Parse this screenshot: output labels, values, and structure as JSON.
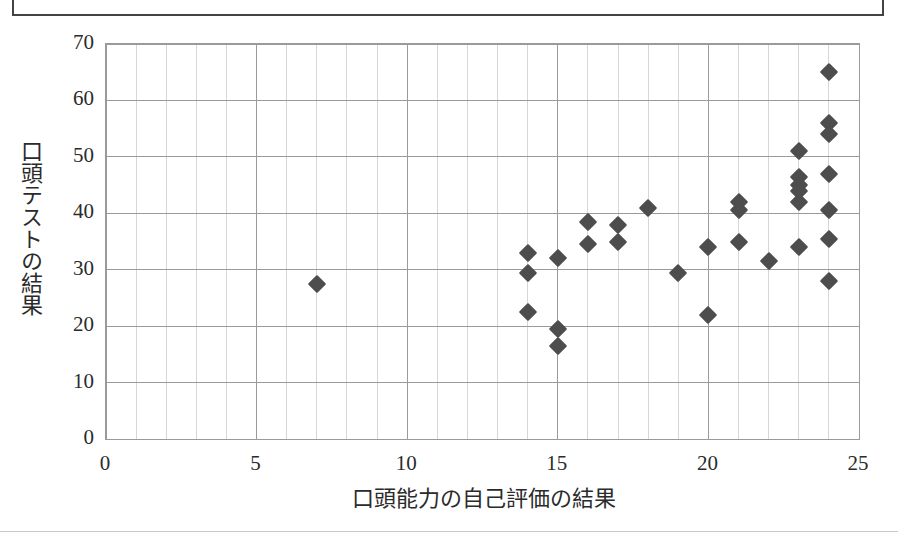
{
  "figure": {
    "y_axis_title": "口頭テストの結果",
    "x_axis_title": "口頭能力の自己評価の結果"
  },
  "chart_data": {
    "type": "scatter",
    "title": "",
    "xlabel": "口頭能力の自己評価の結果",
    "ylabel": "口頭テストの結果",
    "xlim": [
      0,
      25
    ],
    "ylim": [
      0,
      70
    ],
    "xticks": [
      0,
      5,
      10,
      15,
      20,
      25
    ],
    "yticks": [
      0,
      10,
      20,
      30,
      40,
      50,
      60,
      70
    ],
    "xtick_labels": [
      "0",
      "5",
      "10",
      "15",
      "20",
      "25"
    ],
    "ytick_labels": [
      "0",
      "10",
      "20",
      "30",
      "40",
      "50",
      "60",
      "70"
    ],
    "grid": true,
    "grid_minor_x_step": 1,
    "grid_major_y_step": 10,
    "legend": false,
    "marker": "diamond",
    "marker_color": "#4d4d4d",
    "series": [
      {
        "name": "",
        "points": [
          [
            7,
            27.5
          ],
          [
            14,
            33.0
          ],
          [
            14,
            29.5
          ],
          [
            14,
            22.5
          ],
          [
            15,
            32.0
          ],
          [
            15,
            19.5
          ],
          [
            15,
            16.5
          ],
          [
            16,
            38.5
          ],
          [
            16,
            34.5
          ],
          [
            17,
            38.0
          ],
          [
            17,
            35.0
          ],
          [
            18,
            41.0
          ],
          [
            19,
            29.5
          ],
          [
            20,
            34.0
          ],
          [
            20,
            22.0
          ],
          [
            21,
            42.0
          ],
          [
            21,
            40.5
          ],
          [
            21,
            35.0
          ],
          [
            22,
            31.5
          ],
          [
            23,
            51.0
          ],
          [
            23,
            46.5
          ],
          [
            23,
            45.0
          ],
          [
            23,
            44.0
          ],
          [
            23,
            42.0
          ],
          [
            23,
            34.0
          ],
          [
            24,
            65.0
          ],
          [
            24,
            56.0
          ],
          [
            24,
            54.0
          ],
          [
            24,
            47.0
          ],
          [
            24,
            40.5
          ],
          [
            24,
            35.5
          ],
          [
            24,
            28.0
          ]
        ]
      }
    ]
  }
}
